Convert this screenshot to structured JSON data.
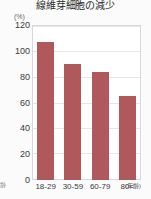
{
  "chart_data": {
    "type": "bar",
    "title": "線維芽細胞の減少",
    "xlabel": "(年齢)",
    "ylabel": "(%)",
    "categories": [
      "18-29",
      "30-59",
      "60-79",
      "80<"
    ],
    "values": [
      107,
      90,
      84,
      65
    ],
    "ylim": [
      0,
      120
    ],
    "yticks": [
      0,
      20,
      40,
      60,
      80,
      100,
      120
    ],
    "ytick_labels": [
      "0",
      "20",
      "40",
      "60",
      "80",
      "100",
      "120"
    ],
    "grid": true,
    "legend": "none",
    "bar_color": "#b0595c",
    "background_color": "#ffffff"
  },
  "annotations": {
    "y_unit": "(%)",
    "x_note": "(年齢)",
    "left_edge_fragment": "齢"
  }
}
